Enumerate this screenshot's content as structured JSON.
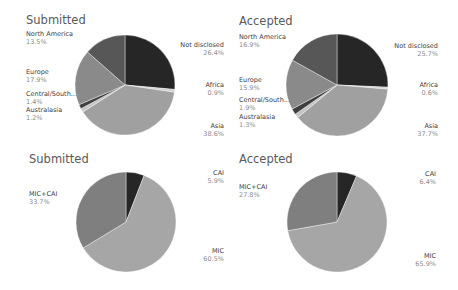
{
  "chart_data": [
    {
      "type": "pie",
      "title": "Submitted",
      "categories": [
        "Not disclosed",
        "Africa",
        "Asia",
        "Australasia",
        "Central/South...",
        "Europe",
        "North America"
      ],
      "values": [
        26.4,
        0.9,
        38.6,
        1.2,
        1.4,
        17.9,
        13.5
      ],
      "labels": [
        "26.4%",
        "0.9%",
        "38.6%",
        "1.2%",
        "1.4%",
        "17.9%",
        "13.5%"
      ],
      "colors": [
        "#262626",
        "#cfcfcf",
        "#a0a0a0",
        "#c4c4c4",
        "#3f3f3f",
        "#8a8a8a",
        "#575757"
      ]
    },
    {
      "type": "pie",
      "title": "Accepted",
      "categories": [
        "Not disclosed",
        "Africa",
        "Asia",
        "Australasia",
        "Central/South...",
        "Europe",
        "North America"
      ],
      "values": [
        25.7,
        0.6,
        37.7,
        1.3,
        1.9,
        15.9,
        16.9
      ],
      "labels": [
        "25.7%",
        "0.6%",
        "37.7%",
        "1.3%",
        "1.9%",
        "15.9%",
        "16.9%"
      ],
      "colors": [
        "#262626",
        "#cfcfcf",
        "#a0a0a0",
        "#c4c4c4",
        "#3f3f3f",
        "#8a8a8a",
        "#575757"
      ]
    },
    {
      "type": "pie",
      "title": "Submitted",
      "categories": [
        "CAI",
        "MIC",
        "MIC+CAI"
      ],
      "values": [
        5.9,
        60.5,
        33.7
      ],
      "labels": [
        "5.9%",
        "60.5%",
        "33.7%"
      ],
      "colors": [
        "#262626",
        "#a6a6a6",
        "#7f7f7f"
      ]
    },
    {
      "type": "pie",
      "title": "Accepted",
      "categories": [
        "CAI",
        "MIC",
        "MIC+CAI"
      ],
      "values": [
        6.4,
        65.9,
        27.8
      ],
      "labels": [
        "6.4%",
        "65.9%",
        "27.8%"
      ],
      "colors": [
        "#262626",
        "#a6a6a6",
        "#7f7f7f"
      ]
    }
  ],
  "panels": {
    "tl": {
      "title": "Submitted"
    },
    "tr": {
      "title": "Accepted"
    },
    "bl": {
      "title": "Submitted"
    },
    "br": {
      "title": "Accepted"
    }
  }
}
